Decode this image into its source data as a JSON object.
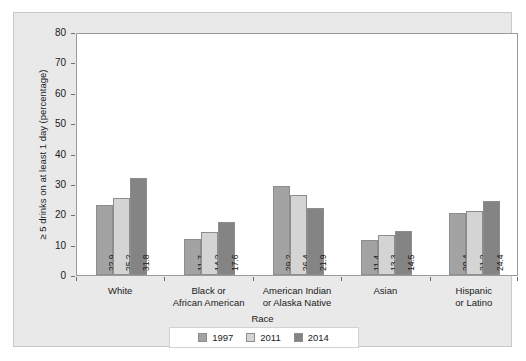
{
  "chart_data": {
    "type": "bar",
    "title": "",
    "subtitle": "",
    "xlabel": "Race",
    "ylabel": "≥ 5 drinks on at least 1 day (percentage)",
    "categories": [
      "White",
      "Black or African American",
      "American Indian or Alaska Native",
      "Asian",
      "Hispanic or Latino"
    ],
    "category_lines": [
      [
        "White"
      ],
      [
        "Black or",
        "African American"
      ],
      [
        "American Indian",
        "or Alaska Native"
      ],
      [
        "Asian"
      ],
      [
        "Hispanic",
        "or Latino"
      ]
    ],
    "series": [
      {
        "name": "1997",
        "color": "#a3a3a3",
        "values": [
          22.9,
          11.7,
          29.2,
          11.4,
          20.4
        ]
      },
      {
        "name": "2011",
        "color": "#d4d4d4",
        "values": [
          25.2,
          14.2,
          26.4,
          13.3,
          21.2
        ]
      },
      {
        "name": "2014",
        "color": "#848484",
        "values": [
          31.8,
          17.6,
          21.9,
          14.5,
          24.4
        ]
      }
    ],
    "ylim": [
      0,
      80
    ],
    "yticks": [
      0,
      10,
      20,
      30,
      40,
      50,
      60,
      70,
      80
    ],
    "ytick_labels": [
      "0",
      "10",
      "20",
      "30",
      "40",
      "50",
      "60",
      "70",
      "80"
    ],
    "grid": false,
    "legend_position": "bottom",
    "bar_value_labels": [
      [
        "22.9",
        "25.2",
        "31.8"
      ],
      [
        "11.7",
        "14.2",
        "17.6"
      ],
      [
        "29.2",
        "26.4",
        "21.9"
      ],
      [
        "11.4",
        "13.3",
        "14.5"
      ],
      [
        "20.4",
        "21.2",
        "24.4"
      ]
    ]
  }
}
